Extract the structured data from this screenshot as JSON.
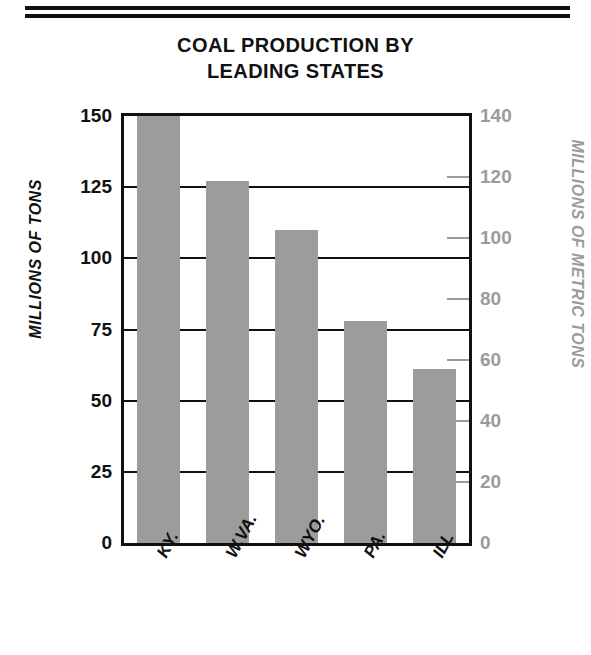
{
  "title": {
    "line1": "COAL PRODUCTION BY",
    "line2": "LEADING STATES"
  },
  "axes": {
    "left_title": "MILLIONS OF TONS",
    "right_title": "MILLIONS OF METRIC TONS",
    "left_ticks": [
      "0",
      "25",
      "50",
      "75",
      "100",
      "125",
      "150"
    ],
    "right_ticks": [
      "0",
      "20",
      "40",
      "60",
      "80",
      "100",
      "120",
      "140"
    ]
  },
  "categories": [
    "KY.",
    "W.VA.",
    "WYO.",
    "PA.",
    "ILL"
  ],
  "colors": {
    "bar_fill": "#9c9c9c",
    "axis_black": "#111111",
    "secondary_gray": "#9b9b9b"
  },
  "chart_data": {
    "type": "bar",
    "title": "COAL PRODUCTION BY LEADING STATES",
    "xlabel": "",
    "ylabel": "MILLIONS OF TONS",
    "y2label": "MILLIONS OF METRIC TONS",
    "categories": [
      "KY.",
      "W.VA.",
      "WYO.",
      "PA.",
      "ILL"
    ],
    "values": [
      150,
      127,
      110,
      78,
      61
    ],
    "ylim": [
      0,
      150
    ],
    "yticks": [
      0,
      25,
      50,
      75,
      100,
      125,
      150
    ],
    "y2lim": [
      0,
      140
    ],
    "y2ticks": [
      0,
      20,
      40,
      60,
      80,
      100,
      120,
      140
    ],
    "grid": true,
    "legend": "none",
    "series": [
      {
        "name": "Coal production",
        "values": [
          150,
          127,
          110,
          78,
          61
        ]
      }
    ]
  }
}
